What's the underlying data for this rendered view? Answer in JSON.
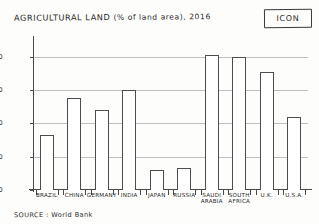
{
  "chart_data": {
    "type": "bar",
    "title": "AGRICULTURAL LAND (% of land area), 2016",
    "title_main": "AGRICULTURAL LAND",
    "title_paren": "(% of land area), 2016",
    "xlabel": "",
    "ylabel": "",
    "ylim": [
      0,
      90
    ],
    "yticks": [
      0,
      20,
      40,
      60,
      80
    ],
    "ytick_labels": [
      "0",
      "20",
      "40",
      "60",
      "80"
    ],
    "grid": true,
    "legend": false,
    "categories": [
      "BRAZIL",
      "CHINA",
      "GERMANY",
      "INDIA",
      "JAPAN",
      "RUSSIA",
      "SAUDI ARABIA",
      "SOUTH AFRICA",
      "U.K.",
      "U.S.A."
    ],
    "category_lines": [
      [
        "BRAZIL"
      ],
      [
        "CHINA"
      ],
      [
        "GERMANY"
      ],
      [
        "INDIA"
      ],
      [
        "JAPAN"
      ],
      [
        "RUSSIA"
      ],
      [
        "SAUDI",
        "ARABIA"
      ],
      [
        "SOUTH",
        "AFRICA"
      ],
      [
        "U.K."
      ],
      [
        "U.S.A."
      ]
    ],
    "values": [
      33,
      55,
      48,
      60,
      12,
      13,
      81,
      80,
      71,
      44
    ],
    "source": "SOURCE : World Bank",
    "bar_color": "#ffffff",
    "bar_edge_color": "#4d4d4d",
    "grid_color": "#bfbfbf",
    "axis_color": "#4a4a4a"
  },
  "annotations": {
    "icon_label": "ICON"
  }
}
